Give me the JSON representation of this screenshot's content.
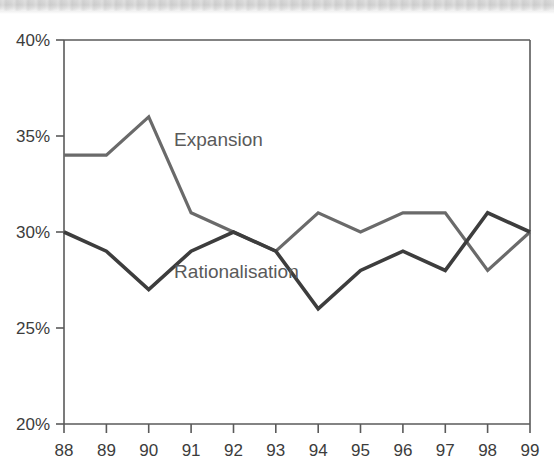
{
  "chart_data": {
    "type": "line",
    "title": "",
    "subtitle": "",
    "xlabel": "",
    "ylabel": "",
    "x": [
      "88",
      "89",
      "90",
      "91",
      "92",
      "93",
      "94",
      "95",
      "96",
      "97",
      "98",
      "99"
    ],
    "categories": [
      "88",
      "89",
      "90",
      "91",
      "92",
      "93",
      "94",
      "95",
      "96",
      "97",
      "98",
      "99"
    ],
    "xlim": [
      88,
      99
    ],
    "ylim": [
      20,
      40
    ],
    "ytick_labels": [
      "40%",
      "35%",
      "30%",
      "25%",
      "20%"
    ],
    "ytick_values": [
      40,
      35,
      30,
      25,
      20
    ],
    "xtick_labels": [
      "88",
      "89",
      "90",
      "91",
      "92",
      "93",
      "94",
      "95",
      "96",
      "97",
      "98",
      "99"
    ],
    "grid": false,
    "legend_position": "inline-annotation",
    "series": [
      {
        "name": "Expansion",
        "color": "#6a6a6a",
        "values": [
          34,
          34,
          36,
          31,
          30,
          29,
          31,
          30,
          31,
          31,
          28,
          30
        ]
      },
      {
        "name": "Rationalisation",
        "color": "#3d3d3d",
        "values": [
          30,
          29,
          27,
          29,
          30,
          29,
          26,
          28,
          29,
          28,
          31,
          30
        ]
      }
    ],
    "annotations": [
      {
        "text": "Expansion",
        "x": 90.6,
        "y": 34.8
      },
      {
        "text": "Rationalisation",
        "x": 90.6,
        "y": 27.9
      }
    ]
  },
  "axes": {
    "y_axis_name": "percent-axis",
    "x_axis_name": "year-axis"
  },
  "colors": {
    "expansion": "#6a6a6a",
    "rationalisation": "#3d3d3d",
    "axis": "#5a5a5a",
    "tick_text": "#3c3c3c",
    "annotation_text": "#5a5a5a",
    "background": "#ffffff"
  }
}
